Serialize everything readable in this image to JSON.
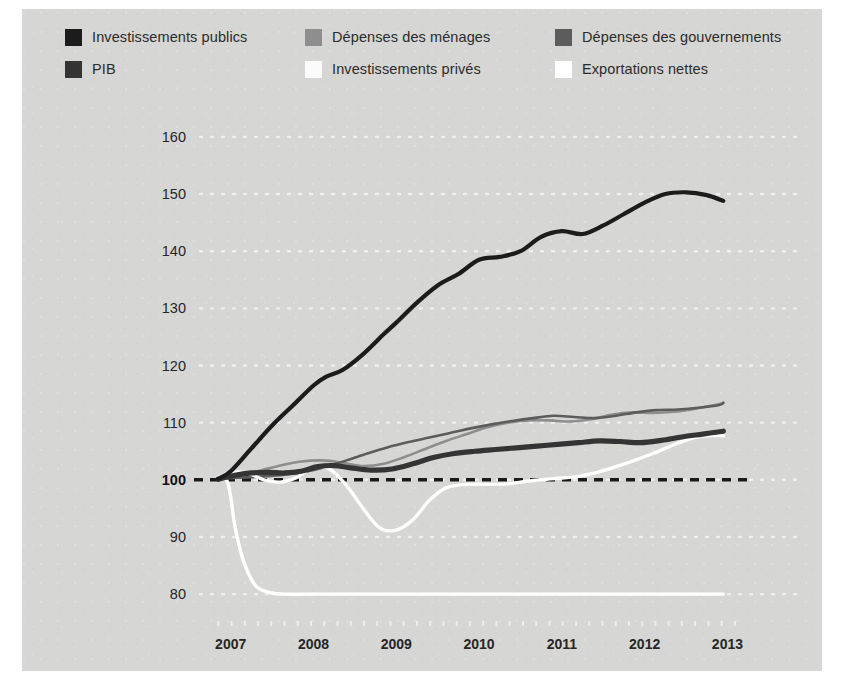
{
  "figure": {
    "background_color": "#d6d6d4",
    "page_color": "#ffffff"
  },
  "legend": {
    "position": "top",
    "items": [
      {
        "label": "Investissements publics",
        "color": "#1c1c1c",
        "icon": "legend-swatch-icon"
      },
      {
        "label": "Dépenses des ménages",
        "color": "#8e8e8e",
        "icon": "legend-swatch-icon"
      },
      {
        "label": "Dépenses des gouvernements",
        "color": "#5c5c5c",
        "icon": "legend-swatch-icon"
      },
      {
        "label": "PIB",
        "color": "#343434",
        "icon": "legend-swatch-icon"
      },
      {
        "label": "Investissements privés",
        "color": "#fbfbfb",
        "icon": "legend-swatch-icon"
      },
      {
        "label": "Exportations nettes",
        "color": "#ffffff",
        "icon": "legend-swatch-icon"
      }
    ]
  },
  "chart_data": {
    "type": "line",
    "title": "",
    "subtitle": "",
    "xlabel": "",
    "ylabel": "",
    "xlim": [
      2006.75,
      2013.2
    ],
    "ylim": [
      76,
      164
    ],
    "grid": "dotted-white-horizontal",
    "baseline": {
      "value": 100,
      "style": "dashed",
      "color": "#1a1a1a"
    },
    "x_ticks": [
      2007,
      2008,
      2009,
      2010,
      2011,
      2012,
      2013
    ],
    "x_tick_labels": [
      "2007",
      "2008",
      "2009",
      "2010",
      "2011",
      "2012",
      "2013"
    ],
    "y_ticks": [
      80,
      90,
      100,
      110,
      120,
      130,
      140,
      150,
      160
    ],
    "y_tick_labels": [
      "80",
      "90",
      "100",
      "110",
      "120",
      "130",
      "140",
      "150",
      "160"
    ],
    "y_tick_emphasis": "100",
    "series": [
      {
        "name": "Investissements publics",
        "color": "#1c1c1c",
        "width": 4.2,
        "x": [
          2006.85,
          2007.0,
          2007.25,
          2007.5,
          2007.75,
          2008.0,
          2008.15,
          2008.35,
          2008.6,
          2008.85,
          2009.0,
          2009.25,
          2009.5,
          2009.75,
          2010.0,
          2010.25,
          2010.5,
          2010.75,
          2011.0,
          2011.25,
          2011.5,
          2011.75,
          2012.0,
          2012.25,
          2012.5,
          2012.75,
          2012.95
        ],
        "values": [
          100.2,
          101.5,
          105.5,
          109.5,
          113.0,
          116.5,
          118.0,
          119.2,
          122.0,
          125.5,
          127.5,
          131.0,
          134.0,
          136.0,
          138.5,
          139.0,
          140.0,
          142.5,
          143.5,
          143.0,
          144.5,
          146.5,
          148.5,
          150.0,
          150.3,
          149.8,
          148.8
        ]
      },
      {
        "name": "Dépenses des ménages",
        "color": "#8e8e8e",
        "width": 2.6,
        "x": [
          2006.85,
          2007.1,
          2007.35,
          2007.6,
          2007.85,
          2008.1,
          2008.35,
          2008.6,
          2008.85,
          2009.1,
          2009.35,
          2009.6,
          2009.85,
          2010.1,
          2010.35,
          2010.6,
          2010.85,
          2011.1,
          2011.35,
          2011.6,
          2011.85,
          2012.1,
          2012.35,
          2012.6,
          2012.85,
          2012.95
        ],
        "values": [
          100.2,
          100.8,
          101.6,
          102.5,
          103.2,
          103.4,
          103.0,
          102.4,
          102.8,
          104.0,
          105.4,
          106.8,
          108.0,
          109.2,
          110.0,
          110.4,
          110.4,
          110.2,
          110.6,
          111.4,
          111.8,
          111.7,
          111.9,
          112.4,
          113.1,
          113.4
        ]
      },
      {
        "name": "Dépenses des gouvernements",
        "color": "#5c5c5c",
        "width": 2.6,
        "x": [
          2006.85,
          2007.15,
          2007.4,
          2007.65,
          2007.9,
          2008.15,
          2008.4,
          2008.65,
          2008.9,
          2009.15,
          2009.4,
          2009.65,
          2009.9,
          2010.15,
          2010.4,
          2010.65,
          2010.9,
          2011.15,
          2011.4,
          2011.65,
          2011.9,
          2012.15,
          2012.4,
          2012.65,
          2012.9,
          2012.95
        ],
        "values": [
          100.2,
          100.4,
          100.6,
          100.9,
          101.4,
          102.3,
          103.4,
          104.6,
          105.7,
          106.6,
          107.4,
          108.2,
          109.0,
          109.7,
          110.3,
          110.8,
          111.2,
          111.0,
          110.8,
          111.2,
          111.8,
          112.2,
          112.3,
          112.6,
          113.1,
          113.5
        ]
      },
      {
        "name": "PIB",
        "color": "#343434",
        "width": 5.2,
        "x": [
          2006.85,
          2007.05,
          2007.25,
          2007.45,
          2007.65,
          2007.85,
          2008.05,
          2008.25,
          2008.45,
          2008.7,
          2008.95,
          2009.2,
          2009.45,
          2009.7,
          2009.95,
          2010.2,
          2010.45,
          2010.7,
          2010.95,
          2011.2,
          2011.45,
          2011.7,
          2011.95,
          2012.2,
          2012.45,
          2012.7,
          2012.95
        ],
        "values": [
          100.1,
          100.8,
          101.2,
          101.3,
          101.2,
          101.5,
          102.3,
          102.5,
          102.1,
          101.7,
          101.9,
          102.8,
          103.9,
          104.6,
          105.0,
          105.3,
          105.6,
          105.9,
          106.2,
          106.5,
          106.8,
          106.7,
          106.5,
          106.9,
          107.5,
          108.0,
          108.5
        ]
      },
      {
        "name": "Investissements privés",
        "color": "#ffffff",
        "width": 3.4,
        "x": [
          2006.85,
          2006.95,
          2007.0,
          2007.05,
          2007.15,
          2007.3,
          2007.5,
          2007.7,
          2007.9,
          2008.1,
          2008.3,
          2008.5,
          2008.7,
          2008.9,
          2009.1,
          2009.3,
          2009.5,
          2009.75,
          2010.0,
          2010.3,
          2010.6,
          2010.9,
          2011.2,
          2011.5,
          2011.8,
          2012.1,
          2012.4,
          2012.65,
          2012.85,
          2012.95
        ],
        "values": [
          100.5,
          100.0,
          97.0,
          92.0,
          86.0,
          81.5,
          80.2,
          80.0,
          80.0,
          80.0,
          80.0,
          80.0,
          80.0,
          80.0,
          80.0,
          80.0,
          80.0,
          80.0,
          80.0,
          80.0,
          80.0,
          80.0,
          80.0,
          80.0,
          80.0,
          80.0,
          80.0,
          80.0,
          80.0,
          80.0
        ]
      },
      {
        "name": "Exportations nettes",
        "color": "#ffffff",
        "width": 3.4,
        "x": [
          2006.85,
          2007.0,
          2007.2,
          2007.4,
          2007.6,
          2007.8,
          2008.0,
          2008.2,
          2008.4,
          2008.6,
          2008.8,
          2009.0,
          2009.2,
          2009.4,
          2009.6,
          2009.85,
          2010.1,
          2010.35,
          2010.6,
          2010.9,
          2011.2,
          2011.5,
          2011.8,
          2012.1,
          2012.4,
          2012.6,
          2012.8,
          2012.95
        ],
        "values": [
          100.4,
          101.3,
          101.2,
          100.0,
          99.6,
          100.4,
          102.3,
          101.8,
          99.0,
          95.0,
          91.6,
          91.2,
          93.0,
          96.4,
          98.6,
          99.2,
          99.2,
          99.3,
          99.8,
          100.2,
          100.6,
          101.6,
          103.0,
          104.6,
          106.4,
          107.4,
          107.8,
          107.7
        ]
      }
    ]
  }
}
